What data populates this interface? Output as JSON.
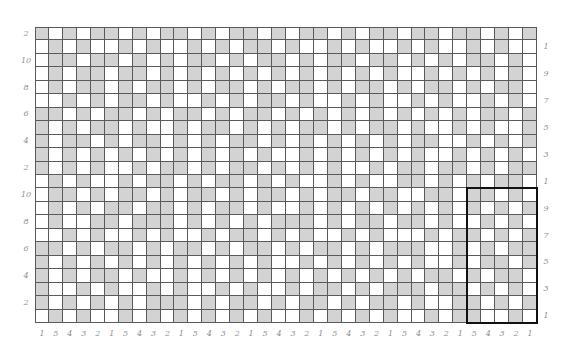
{
  "chart": {
    "columns": 36,
    "rows": 22,
    "colors": {
      "contrast": "#d3d3d3",
      "main": "#ffffff",
      "grid": "#5a5a5a",
      "repeat_box": "#111111",
      "label": "#8f8f8f"
    },
    "cells": [
      "GWGWGGWGWGGWGWGGWGWGGWGWGGWGGWGGWGWGG",
      "WGWGWWGWGWWGWGWGGWGWWGWGWWGWGWWGWGWW",
      "WGGWGGWGWGWGGWGWGGWGWGGWGGWGWGWGGWGW",
      "WGWGGWGGWGWGWGWGWGWGWGWGWGWWGWGWGWGW",
      "WGWGGWGWGGWGWGGWGWGGWGWGGWGWGGWGWGGW",
      "WWGWGWGGWGWWGWGWGGWGWWGWGWWGWGWWGWGW",
      "GGWGWGGWGWGGWGWGGWGWGWGWGWGWGWGWGGWG",
      "GWGWGGWGWWGWGGWGWGWGGWGWGGWGWWGWGWWG",
      "GWGGWGWGGWGWGWGGWGWGWGWGWGWGGWWGWGWGG",
      "GWGWGWGWGWGWGWGWGWWGWGWGWGWGWWGWGWGWWG",
      "GWGWGWWGWGGWGWGGWGWGWGWWGWGGWGGWGWGG",
      "WGWGWWGWGGWGWGGWGWGWWGWGWWGGWGWGWGGW",
      "WGGWGWGGWGWGGWGWGGWGWGGWGGWWGGWGGWGW",
      "WGWGWGGWGGWGWGGWGWWGWGWGWGWGWGWGWGWG",
      "WGWWGGWGGGWGWGWGWGGGWGWGGWGGWGWWGWGW",
      "WWGWGWWGWGWWGWGGWGWGWWGWGWWWGWGGWGWG",
      "GGWGWGGWGWGGWGWGGWGWGGWGWGGGWWGWGWGG",
      "GWGWGWGWGWGWGWGWGWWGWGWGWGWGWWGWGGWG",
      "GWGWGGWGWWGWGWGWGWGWGWGWGWGWGGWGWGGW",
      "GWWGWGWWGWGWWGWGWWGWGGWGWGGGWGGWGWGW",
      "GWGWGWGWGGGWGWGGWGWGGWGWGGWGWWGGWGWG",
      "WGWGWWGWGWGWGWGWGWWGWGWGWGWWGWGGWWGW"
    ],
    "repeat_box": {
      "col_start": 32,
      "col_end": 36,
      "row_start": 13,
      "row_end": 22
    },
    "left_labels": [
      "2",
      "10",
      "8",
      "6",
      "4",
      "2",
      "10",
      "8",
      "6",
      "4",
      "2"
    ],
    "right_labels": [
      "1",
      "9",
      "7",
      "5",
      "3",
      "1",
      "9",
      "7",
      "5",
      "3",
      "1"
    ],
    "bottom_labels": [
      "1",
      "5",
      "4",
      "3",
      "2",
      "1",
      "5",
      "4",
      "3",
      "2",
      "1",
      "5",
      "4",
      "3",
      "2",
      "1",
      "5",
      "4",
      "3",
      "2",
      "1",
      "5",
      "4",
      "3",
      "2",
      "1",
      "5",
      "4",
      "3",
      "2",
      "1",
      "5",
      "4",
      "3",
      "2",
      "1"
    ]
  }
}
